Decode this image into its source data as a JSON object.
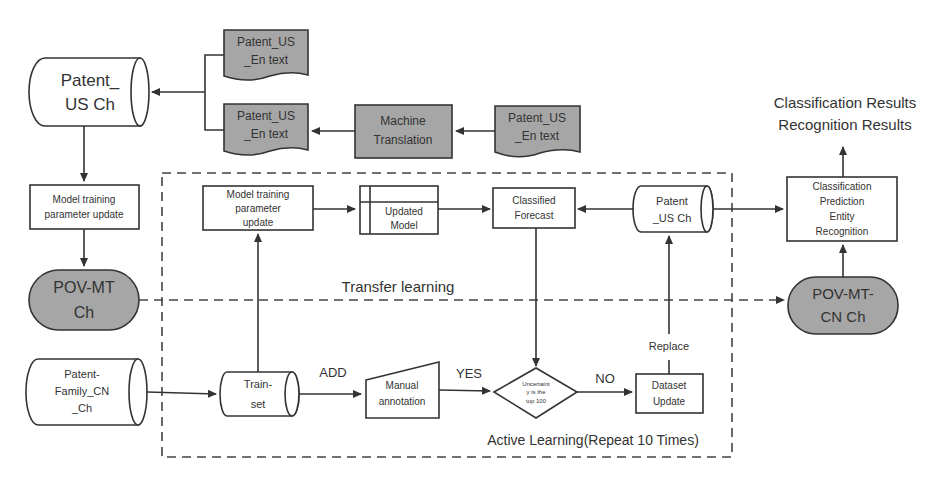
{
  "diagram": {
    "nodes": {
      "patent_us_ch_left": {
        "line1": "Patent_",
        "line2": "US Ch"
      },
      "patent_us_en_text_top": {
        "line1": "Patent_US",
        "line2": "_En text"
      },
      "patent_us_en_text_mid": {
        "line1": "Patent_US",
        "line2": "_En text"
      },
      "machine_translation": {
        "line1": "Machine",
        "line2": "Translation"
      },
      "patent_us_en_text_right": {
        "line1": "Patent_US",
        "line2": "_En text"
      },
      "model_training_left": {
        "line1": "Model training",
        "line2": "parameter update"
      },
      "pov_mt_ch": {
        "line1": "POV-MT",
        "line2": "Ch"
      },
      "patent_family_cn_ch": {
        "line1": "Patent-",
        "line2": "Family_CN",
        "line3": "_Ch"
      },
      "model_training_inner": {
        "line1": "Model training",
        "line2": "parameter",
        "line3": "update"
      },
      "updated_model": {
        "line1": "Updated",
        "line2": "Model"
      },
      "classified_forecast": {
        "line1": "Classified",
        "line2": "Forecast"
      },
      "patent_us_ch_inner": {
        "line1": "Patent",
        "line2": "_US Ch"
      },
      "train_set": {
        "line1": "Train-",
        "line2": "set"
      },
      "manual_annotation": {
        "line1": "Manual",
        "line2": "annotation"
      },
      "uncertainty_decision": {
        "line1": "Uncertaint",
        "line2": "y is the",
        "line3": "top 100"
      },
      "dataset_update": {
        "line1": "Dataset",
        "line2": "Update"
      },
      "classification_box": {
        "line1": "Classification",
        "line2": "Prediction",
        "line3": "Entity",
        "line4": "Recognition"
      },
      "pov_mt_cn_ch": {
        "line1": "POV-MT-",
        "line2": "CN Ch"
      }
    },
    "labels": {
      "results_line1": "Classification Results",
      "results_line2": "Recognition Results",
      "transfer_learning": "Transfer learning",
      "add": "ADD",
      "yes": "YES",
      "no": "NO",
      "replace": "Replace",
      "active_learning": "Active Learning(Repeat 10 Times)"
    },
    "colors": {
      "gray_fill": "#a6a6a6",
      "stroke": "#333333"
    }
  }
}
